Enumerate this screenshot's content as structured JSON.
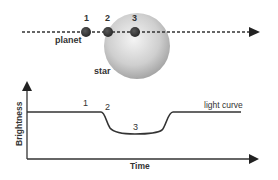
{
  "transit": {
    "planet_label": "planet",
    "star_label": "star",
    "positions": [
      {
        "label": "1",
        "x": 86
      },
      {
        "label": "2",
        "x": 108
      },
      {
        "label": "3",
        "x": 135
      }
    ]
  },
  "light_curve": {
    "curve_label": "light curve",
    "y_axis_label": "Brightness",
    "x_axis_label": "Time",
    "point_labels": [
      "1",
      "2",
      "3"
    ]
  },
  "colors": {
    "line": "#333333",
    "planet": "#3a3a3a",
    "star_light": "#f2f2f2",
    "star_dark": "#9a9a9a"
  }
}
